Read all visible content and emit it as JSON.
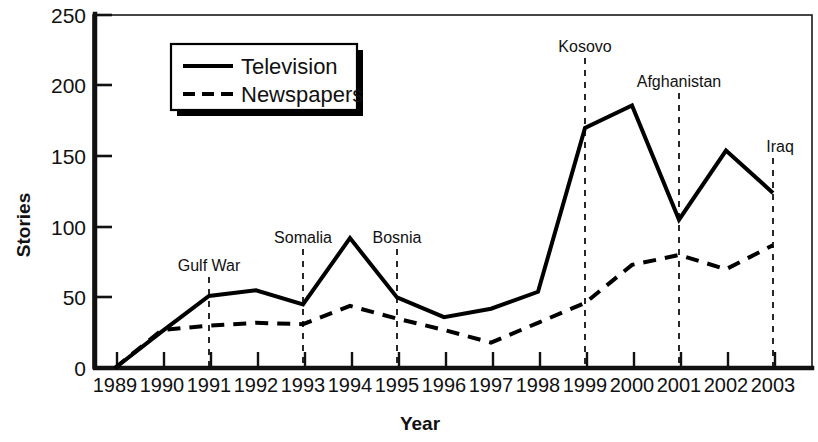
{
  "chart_data": {
    "type": "line",
    "title": "",
    "xlabel": "Year",
    "ylabel": "Stories",
    "x": [
      1989,
      1990,
      1991,
      1992,
      1993,
      1994,
      1995,
      1996,
      1997,
      1998,
      1999,
      2000,
      2001,
      2002,
      2003
    ],
    "categories": [
      "1989",
      "1990",
      "1991",
      "1992",
      "1993",
      "1994",
      "1995",
      "1996",
      "1997",
      "1998",
      "1999",
      "2000",
      "2001",
      "2002",
      "2003"
    ],
    "series": [
      {
        "name": "Television",
        "style": "solid",
        "values": [
          0,
          26,
          51,
          55,
          45,
          92,
          50,
          36,
          42,
          54,
          170,
          186,
          105,
          154,
          124
        ]
      },
      {
        "name": "Newspapers",
        "style": "dashed",
        "values": [
          0,
          27,
          30,
          32,
          31,
          44,
          35,
          27,
          18,
          32,
          46,
          73,
          80,
          70,
          87
        ]
      }
    ],
    "ylim": [
      0,
      250
    ],
    "yticks": [
      0,
      50,
      100,
      150,
      200,
      250
    ],
    "ytick_labels": [
      "0",
      "50",
      "100",
      "150",
      "200",
      "250"
    ],
    "xlim": [
      1989,
      2003
    ],
    "grid": false,
    "legend_position": "upper-left-inside",
    "annotations": [
      {
        "label": "Gulf War",
        "year": 1991
      },
      {
        "label": "Somalia",
        "year": 1993
      },
      {
        "label": "Bosnia",
        "year": 1995
      },
      {
        "label": "Kosovo",
        "year": 1999
      },
      {
        "label": "Afghanistan",
        "year": 2001
      },
      {
        "label": "Iraq",
        "year": 2003
      }
    ]
  },
  "legend": {
    "items": [
      {
        "label": "Television"
      },
      {
        "label": "Newspapers"
      }
    ]
  },
  "axis": {
    "y_title": "Stories",
    "x_title": "Year",
    "y_labels": [
      "250",
      "200",
      "150",
      "100",
      "50",
      "0"
    ],
    "x_labels": [
      "1989",
      "1990",
      "1991",
      "1992",
      "1993",
      "1994",
      "1995",
      "1996",
      "1997",
      "1998",
      "1999",
      "2000",
      "2001",
      "2002",
      "2003"
    ]
  },
  "annotation_labels": {
    "gulf_war": "Gulf War",
    "somalia": "Somalia",
    "bosnia": "Bosnia",
    "kosovo": "Kosovo",
    "afghanistan": "Afghanistan",
    "iraq": "Iraq"
  },
  "colors": {
    "ink": "#000000",
    "background": "#ffffff"
  }
}
